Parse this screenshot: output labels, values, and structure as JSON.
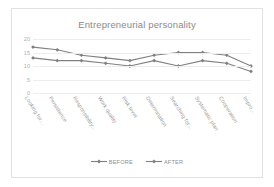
{
  "chart_data": {
    "type": "line",
    "title": "Entrepreneurial personality",
    "xlabel": "",
    "ylabel": "",
    "ylim": [
      0,
      20
    ],
    "yticks": [
      "0",
      "5",
      "10",
      "15",
      "20"
    ],
    "grid": true,
    "legend_position": "bottom",
    "categories": [
      "Looking for...",
      "Persistence",
      "Responsibility...",
      "Work quality",
      "Risk level",
      "Determination",
      "Searching for...",
      "Systematic plan",
      "Cooperation",
      "Impro..."
    ],
    "series": [
      {
        "name": "BEFORE",
        "color": "#808080",
        "values": [
          17,
          16,
          14,
          13,
          12,
          14,
          15,
          15,
          14,
          10
        ]
      },
      {
        "name": "AFTER",
        "color": "#808080",
        "values": [
          13,
          12,
          12,
          11,
          10,
          12,
          10,
          12,
          11,
          8
        ]
      }
    ]
  }
}
